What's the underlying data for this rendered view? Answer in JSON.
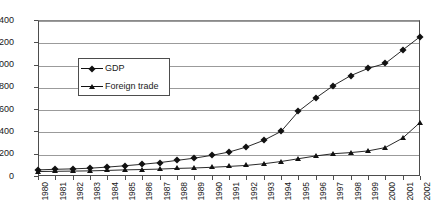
{
  "chart_data": {
    "type": "line",
    "title": "",
    "subtitle": "",
    "xlabel": "",
    "ylabel": "",
    "ylim": [
      0,
      1400
    ],
    "ytick_step": 200,
    "yticks": [
      0,
      200,
      400,
      600,
      800,
      1000,
      1200,
      1400
    ],
    "grid": true,
    "grid_axis": "y",
    "legend_position": "upper-left-inside",
    "categories": [
      "1980",
      "1981",
      "1982",
      "1983",
      "1984",
      "1985",
      "1986",
      "1987",
      "1988",
      "1989",
      "1990",
      "1991",
      "1992",
      "1993",
      "1994",
      "1995",
      "1996",
      "1997",
      "1998",
      "1999",
      "2000",
      "2001",
      "2002"
    ],
    "series": [
      {
        "name": "GDP",
        "marker": "diamond",
        "color": "#111111",
        "values": [
          55,
          60,
          64,
          70,
          80,
          92,
          105,
          120,
          140,
          160,
          185,
          215,
          260,
          320,
          400,
          580,
          700,
          810,
          900,
          965,
          1010,
          1130,
          1250
        ]
      },
      {
        "name": "Foreign trade",
        "marker": "triangle",
        "color": "#111111",
        "values": [
          40,
          42,
          44,
          46,
          50,
          55,
          58,
          62,
          68,
          72,
          78,
          86,
          95,
          110,
          130,
          155,
          180,
          200,
          210,
          225,
          255,
          340,
          480
        ]
      }
    ]
  },
  "legend": {
    "items": [
      {
        "label": "GDP",
        "marker": "diamond"
      },
      {
        "label": "Foreign trade",
        "marker": "triangle"
      }
    ]
  }
}
